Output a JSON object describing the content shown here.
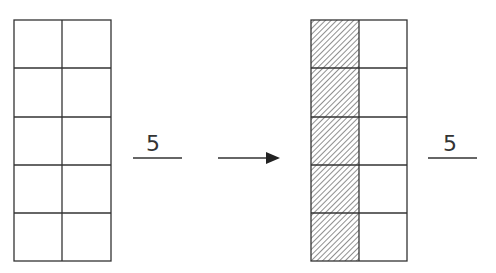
{
  "diagram": {
    "left_grid": {
      "rows": 5,
      "cols": 2,
      "shaded_cells": []
    },
    "left_fraction": {
      "numerator": "",
      "denominator": "5"
    },
    "arrow": {
      "direction": "right"
    },
    "right_grid": {
      "rows": 5,
      "cols": 2,
      "shaded_cells": "left column (5 cells)"
    },
    "right_fraction": {
      "numerator": "",
      "denominator": "5"
    },
    "colors": {
      "line": "#333333",
      "background": "#ffffff"
    }
  }
}
